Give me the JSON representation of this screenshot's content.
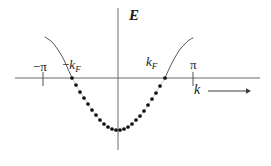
{
  "figure": {
    "kind": "energy-band-dispersion-diagram",
    "background_color": "#ffffff",
    "line_color": "#555555",
    "dot_color": "#111111",
    "text_color": "#1a1a1a"
  },
  "axes": {
    "vertical": {
      "label": "E",
      "name": "energy-axis",
      "x": 118,
      "y_top": 8,
      "y_bottom": 150
    },
    "horizontal": {
      "label": "k",
      "name": "wavevector-axis",
      "y": 78,
      "x_left": 15,
      "x_right": 260,
      "arrow_from_x": 208,
      "arrow_to_x": 250,
      "arrow_y": 91
    }
  },
  "ticks": [
    {
      "label": "−π",
      "name": "tick-minus-pi",
      "x": 43
    },
    {
      "label": "π",
      "name": "tick-pi",
      "x": 193
    }
  ],
  "markers": [
    {
      "label_minus": "−",
      "label_k": "k",
      "label_sub": "F",
      "name": "marker-minus-kf",
      "x": 72
    },
    {
      "label_minus": "",
      "label_k": "k",
      "label_sub": "F",
      "name": "marker-kf",
      "x": 165
    }
  ],
  "chart_data": {
    "type": "line",
    "title": "",
    "xlabel": "k",
    "ylabel": "E",
    "xlim": [
      -3.14159,
      3.14159
    ],
    "ylim": [
      -1.0,
      1.15
    ],
    "grid": false,
    "legend": null,
    "annotations": [
      {
        "text": "E",
        "role": "y-axis-label",
        "px": [
          129,
          8
        ]
      },
      {
        "text": "k",
        "role": "x-axis-label",
        "px": [
          194,
          83
        ]
      },
      {
        "text": "-π",
        "role": "x-tick-label",
        "value": -3.14159,
        "px": [
          33,
          60
        ]
      },
      {
        "text": "π",
        "role": "x-tick-label",
        "value": 3.14159,
        "px": [
          190,
          58
        ]
      },
      {
        "text": "-k_F",
        "role": "fermi-wavevector-left",
        "value": -1.22,
        "px": [
          62,
          58
        ]
      },
      {
        "text": "k_F",
        "role": "fermi-wavevector-right",
        "value": 1.22,
        "px": [
          146,
          55
        ]
      }
    ],
    "series": [
      {
        "name": "dispersion-band-empty-left",
        "style": "solid",
        "description": "unoccupied band branch left of -k_F rising toward -pi",
        "points_px": [
          [
            45,
            37
          ],
          [
            48,
            39
          ],
          [
            52,
            42
          ],
          [
            56,
            47
          ],
          [
            60,
            53
          ],
          [
            64,
            60
          ],
          [
            68,
            69
          ],
          [
            72,
            78
          ]
        ]
      },
      {
        "name": "dispersion-band-filled",
        "style": "dotted",
        "description": "occupied states between -k_F and k_F marked with filled dots",
        "points_px": [
          [
            72,
            78
          ],
          [
            76,
            85
          ],
          [
            80,
            92
          ],
          [
            84,
            98
          ],
          [
            88,
            104
          ],
          [
            92,
            110
          ],
          [
            96,
            115
          ],
          [
            100,
            120
          ],
          [
            104,
            124
          ],
          [
            108,
            127
          ],
          [
            112,
            129
          ],
          [
            116,
            130
          ],
          [
            120,
            130
          ],
          [
            124,
            129
          ],
          [
            128,
            127
          ],
          [
            132,
            124
          ],
          [
            136,
            120
          ],
          [
            140,
            116
          ],
          [
            144,
            111
          ],
          [
            148,
            105
          ],
          [
            152,
            99
          ],
          [
            156,
            93
          ],
          [
            160,
            86
          ],
          [
            165,
            78
          ]
        ]
      },
      {
        "name": "dispersion-band-empty-right",
        "style": "solid",
        "description": "unoccupied band branch right of k_F rising toward pi",
        "points_px": [
          [
            165,
            78
          ],
          [
            169,
            69
          ],
          [
            173,
            61
          ],
          [
            177,
            54
          ],
          [
            181,
            48
          ],
          [
            185,
            44
          ],
          [
            189,
            40
          ],
          [
            193,
            38
          ]
        ]
      }
    ]
  }
}
